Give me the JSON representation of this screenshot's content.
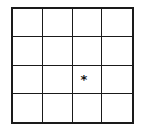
{
  "grid": {
    "rows": 4,
    "cols": 4,
    "line_color": "#1a1a1a",
    "marker": {
      "symbol": "*",
      "row": 3,
      "col": 3,
      "icon": "asterisk-icon"
    }
  }
}
